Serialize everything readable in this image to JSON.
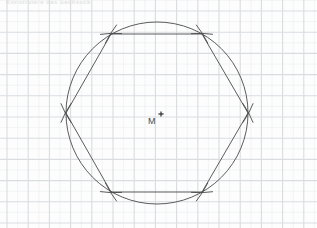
{
  "page": {
    "kind": "geometry-construction-worksheet",
    "background_color": "#fdfdfd",
    "width": 317,
    "height": 228,
    "faint_header_text": "Konstruiere das Sechseck"
  },
  "grid": {
    "minor_spacing": 10.6,
    "major_spacing": 21.2,
    "minor_color": "#eff1f2",
    "major_color": "#d9dde0",
    "origin_x": 7,
    "origin_y": 11,
    "visible": true
  },
  "figure": {
    "ink_color": "#4a4a4a",
    "stroke_width": 0.9,
    "circle": {
      "label": "circumscribed-circle",
      "center_x": 157,
      "center_y": 113,
      "radius": 91
    },
    "center_point": {
      "label": "M",
      "marker": "cross",
      "marker_x": 161,
      "marker_y": 114,
      "label_x": 148,
      "label_y": 117
    },
    "hexagon": {
      "label": "regular-hexagon",
      "sides": 6,
      "vertices": [
        {
          "name": "right",
          "angle_deg": 0,
          "x": 248,
          "y": 113
        },
        {
          "name": "upper-right",
          "angle_deg": 60,
          "x": 202,
          "y": 34
        },
        {
          "name": "upper-left",
          "angle_deg": 120,
          "x": 111,
          "y": 34
        },
        {
          "name": "left",
          "angle_deg": 180,
          "x": 66,
          "y": 113
        },
        {
          "name": "lower-left",
          "angle_deg": 240,
          "x": 111,
          "y": 192
        },
        {
          "name": "lower-right",
          "angle_deg": 300,
          "x": 202,
          "y": 192
        }
      ]
    },
    "compass_arcs": {
      "label": "construction-arc-ticks",
      "count": 12,
      "description": "two short compass arcs crossing at each hexagon vertex",
      "arc_half_length": 11
    }
  }
}
